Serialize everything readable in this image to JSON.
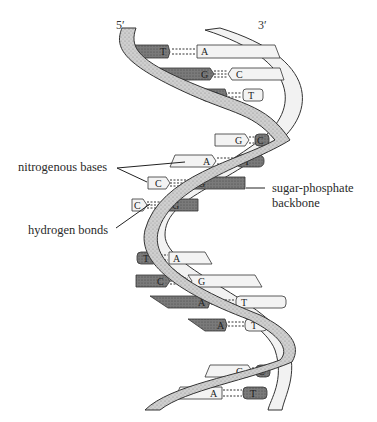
{
  "diagram": {
    "ends": {
      "left": "5′",
      "right": "3′"
    },
    "labels": {
      "nitrogenous_bases": "nitrogenous bases",
      "hydrogen_bonds": "hydrogen bonds",
      "backbone_line1": "sugar-phosphate",
      "backbone_line2": "backbone"
    },
    "base_pairs": [
      {
        "left": "T",
        "right": "A"
      },
      {
        "left": "G",
        "right": "C"
      },
      {
        "left": "A",
        "right": "T"
      },
      {
        "left": "G",
        "right": "C"
      },
      {
        "left": "A",
        "right": "T"
      },
      {
        "left": "C",
        "right": "G"
      },
      {
        "left": "C",
        "right": "G"
      },
      {
        "left": "T",
        "right": "A"
      },
      {
        "left": "C",
        "right": "G"
      },
      {
        "left": "A",
        "right": "T"
      },
      {
        "left": "A",
        "right": "T"
      },
      {
        "left": "G",
        "right": "C"
      },
      {
        "left": "A",
        "right": "T"
      }
    ],
    "colors": {
      "dark_base": "#6e6e6e",
      "light_base": "#eeeeee",
      "strand_fill": "#d8d8d8",
      "outline": "#333333"
    }
  }
}
